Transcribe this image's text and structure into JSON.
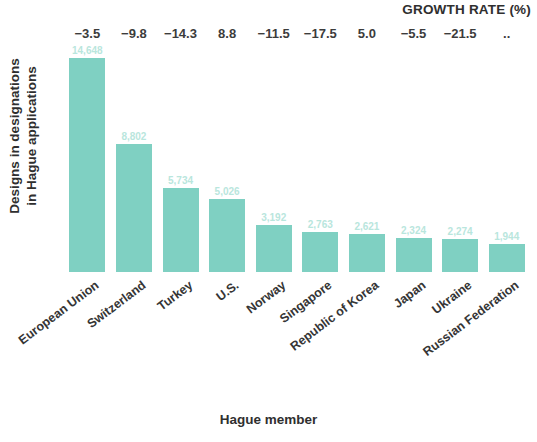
{
  "chart_data": {
    "type": "bar",
    "title": "",
    "xlabel": "Hague member",
    "ylabel": "Designs in designations in Hague applications",
    "ylabel_lines": [
      "Designs in designations",
      "in Hague applications"
    ],
    "grid": false,
    "legend": "none",
    "ylim": [
      0,
      15500
    ],
    "categories": [
      "European Union",
      "Switzerland",
      "Turkey",
      "U.S.",
      "Norway",
      "Singapore",
      "Republic of Korea",
      "Japan",
      "Ukraine",
      "Russian Federation"
    ],
    "values": [
      14648,
      8802,
      5734,
      5026,
      3192,
      2763,
      2621,
      2324,
      2274,
      1944
    ],
    "value_labels": [
      "14,648",
      "8,802",
      "5,734",
      "5,026",
      "3,192",
      "2,763",
      "2,621",
      "2,324",
      "2,274",
      "1,944"
    ],
    "bar_color": "#7fd0c2",
    "value_label_color": "#b9e6dd",
    "secondary_axis": {
      "title": "GROWTH RATE (%)",
      "values": [
        "−3.5",
        "−9.8",
        "−14.3",
        "8.8",
        "−11.5",
        "−17.5",
        "5.0",
        "−5.5",
        "−21.5",
        ".."
      ],
      "numeric": [
        -3.5,
        -9.8,
        -14.3,
        8.8,
        -11.5,
        -17.5,
        5.0,
        -5.5,
        -21.5,
        null
      ]
    }
  }
}
